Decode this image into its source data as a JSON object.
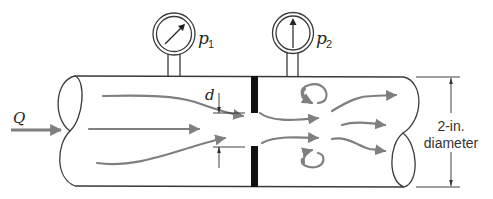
{
  "figure": {
    "labels": {
      "flow_rate": "Q",
      "gauge_1": "p",
      "gauge_1_sub": "1",
      "gauge_2": "p",
      "gauge_2_sub": "2",
      "orifice_diameter": "d",
      "pipe_diameter_line1": "2-in.",
      "pipe_diameter_line2": "diameter"
    },
    "colors": {
      "outline": "#3a3a3a",
      "streamline": "#7f7f7f",
      "orifice_plate": "#111111"
    }
  }
}
